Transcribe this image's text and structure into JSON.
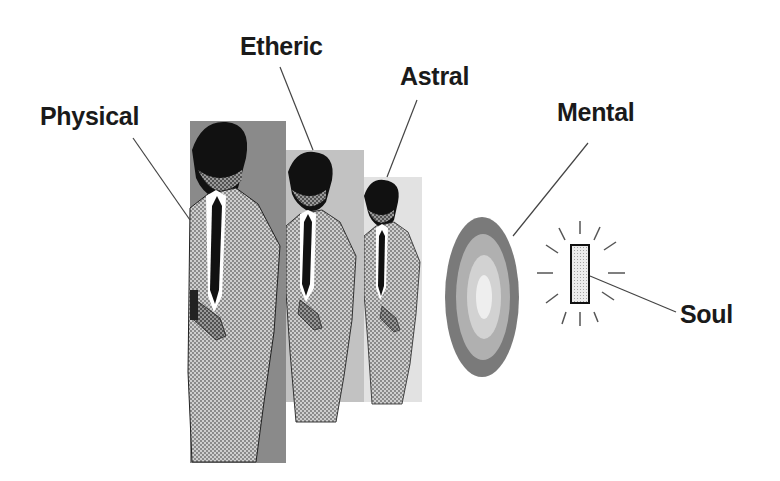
{
  "diagram": {
    "labels": {
      "physical": "Physical",
      "etheric": "Etheric",
      "astral": "Astral",
      "mental": "Mental",
      "soul": "Soul"
    },
    "colors": {
      "ink": "#1a1a1a",
      "physical_bg": "#8a8a8a",
      "etheric_bg": "#c4c4c4",
      "astral_bg": "#e4e4e4",
      "mental_outer": "#7a7a7a",
      "mental_mid": "#b0b0b0",
      "mental_inner": "#d0d0d0",
      "mental_core": "#eeeeee",
      "soul_fill": "#e6e6e6"
    }
  }
}
